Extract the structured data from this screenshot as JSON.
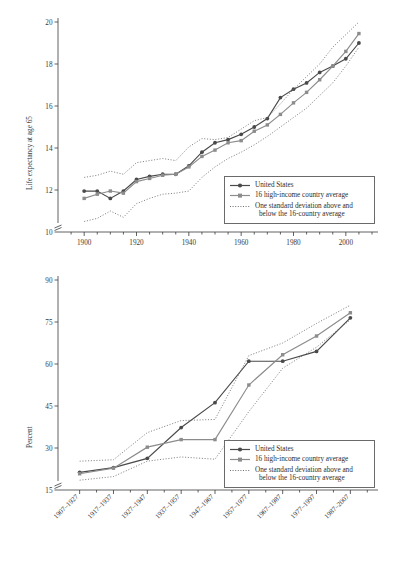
{
  "figure": {
    "background": "#ffffff",
    "ink_color": "#3a3a3a",
    "series_colors": {
      "united_states": "#4a4a4a",
      "country_average": "#8c8c8c",
      "std_dev_band": "#6f6f6f"
    }
  },
  "legend": {
    "items": [
      {
        "label": "United States",
        "key": "line-marker-circle-dark"
      },
      {
        "label": "16 high-income country average",
        "key": "line-marker-square-grey"
      },
      {
        "label": "One standard deviation above and",
        "label2": "below the 16-country average",
        "key": "dotted-line"
      }
    ]
  },
  "chart_data": [
    {
      "id": "life-expectancy-panel",
      "type": "line",
      "title": "",
      "xlabel": "",
      "ylabel": "Life expectancy at age 65",
      "xlim": [
        1890,
        2010
      ],
      "ylim": [
        10,
        20
      ],
      "y_axis_break": true,
      "yticks": [
        10,
        12,
        14,
        16,
        18,
        20
      ],
      "xticks": [
        1900,
        1920,
        1940,
        1960,
        1980,
        2000
      ],
      "grid": false,
      "legend_position": "lower-right",
      "x": [
        1900,
        1905,
        1910,
        1915,
        1920,
        1925,
        1930,
        1935,
        1940,
        1945,
        1950,
        1955,
        1960,
        1965,
        1970,
        1975,
        1980,
        1985,
        1990,
        1995,
        2000,
        2005
      ],
      "series": [
        {
          "name": "United States",
          "marker": "circle",
          "values": [
            11.95,
            11.95,
            11.6,
            11.95,
            12.5,
            12.65,
            12.75,
            12.75,
            13.15,
            13.8,
            14.25,
            14.4,
            14.65,
            15.0,
            15.4,
            16.4,
            16.8,
            17.1,
            17.6,
            17.9,
            18.25,
            19.0
          ]
        },
        {
          "name": "16 high-income country average",
          "marker": "square",
          "values": [
            11.6,
            11.8,
            11.95,
            11.85,
            12.4,
            12.55,
            12.7,
            12.75,
            13.1,
            13.6,
            13.9,
            14.25,
            14.35,
            14.8,
            15.1,
            15.6,
            16.15,
            16.65,
            17.25,
            17.9,
            18.6,
            19.45
          ]
        },
        {
          "name": "One standard deviation above the 16-country average",
          "style": "dotted",
          "values": [
            12.6,
            12.7,
            12.9,
            12.75,
            13.3,
            13.4,
            13.5,
            13.4,
            14.05,
            14.45,
            14.4,
            14.5,
            14.9,
            15.3,
            15.45,
            16.1,
            16.8,
            17.4,
            18.0,
            18.8,
            19.4,
            20.0
          ]
        },
        {
          "name": "One standard deviation below the 16-country average",
          "style": "dotted",
          "values": [
            10.5,
            10.65,
            11.0,
            10.7,
            11.35,
            11.6,
            11.8,
            11.85,
            11.95,
            12.6,
            13.1,
            13.5,
            13.8,
            14.15,
            14.55,
            15.0,
            15.45,
            15.9,
            16.5,
            17.1,
            17.9,
            18.8
          ]
        }
      ]
    },
    {
      "id": "percent-panel",
      "type": "line",
      "title": "",
      "xlabel": "",
      "ylabel": "Percent",
      "ylim": [
        15,
        90
      ],
      "y_axis_break": true,
      "yticks": [
        15,
        30,
        45,
        60,
        75,
        90
      ],
      "xticks": [
        "1907–1927",
        "1917–1937",
        "1927–1947",
        "1937–1957",
        "1947–1967",
        "1957–1977",
        "1967–1987",
        "1977–1997",
        "1987–2007"
      ],
      "grid": false,
      "legend_position": "lower-right",
      "series": [
        {
          "name": "United States",
          "marker": "circle",
          "values": [
            21.3,
            23.0,
            26.3,
            37.3,
            46.2,
            61.0,
            61.0,
            64.5,
            76.5
          ]
        },
        {
          "name": "16 high-income country average",
          "marker": "square",
          "values": [
            20.8,
            22.8,
            30.3,
            33.0,
            33.0,
            52.5,
            63.3,
            70.0,
            78.3
          ]
        },
        {
          "name": "One standard deviation above the 16-country average",
          "style": "dotted",
          "values": [
            25.3,
            25.8,
            35.5,
            39.8,
            40.2,
            63.0,
            67.5,
            74.5,
            81.0
          ]
        },
        {
          "name": "One standard deviation below the 16-country average",
          "style": "dotted",
          "values": [
            18.5,
            19.8,
            25.3,
            26.8,
            26.0,
            43.0,
            58.5,
            66.0,
            75.8
          ]
        }
      ]
    }
  ]
}
